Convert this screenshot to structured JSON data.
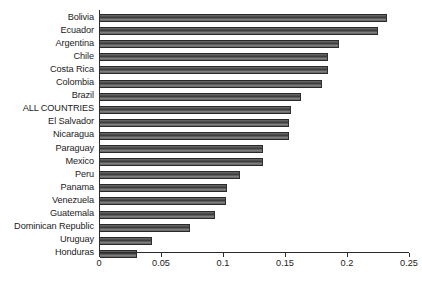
{
  "chart_data": {
    "type": "bar",
    "orientation": "horizontal",
    "title": "",
    "subtitle": "",
    "xlabel": "",
    "ylabel": "",
    "xlim": [
      0,
      0.25
    ],
    "ylim": null,
    "grid": false,
    "legend": null,
    "legend_position": "none",
    "bar_color": "#4a4a4a",
    "axis_color": "#2b2b2b",
    "text_color": "#1c1c1c",
    "background": "#ffffff",
    "xticks": [
      0,
      0.05,
      0.1,
      0.15,
      0.2,
      0.25
    ],
    "xtick_labels": [
      "0",
      "0.05",
      "0.1",
      "0.15",
      "0.2",
      "0.25"
    ],
    "categories": [
      "Bolivia",
      "Ecuador",
      "Argentina",
      "Chile",
      "Costa Rica",
      "Colombia",
      "Brazil",
      "ALL COUNTRIES",
      "El Salvador",
      "Nicaragua",
      "Paraguay",
      "Mexico",
      "Peru",
      "Panama",
      "Venezuela",
      "Guatemala",
      "Dominican Republic",
      "Uruguay",
      "Honduras"
    ],
    "values": [
      0.231,
      0.223,
      0.192,
      0.183,
      0.183,
      0.178,
      0.161,
      0.153,
      0.152,
      0.152,
      0.131,
      0.131,
      0.112,
      0.102,
      0.101,
      0.092,
      0.072,
      0.041,
      0.029
    ]
  }
}
